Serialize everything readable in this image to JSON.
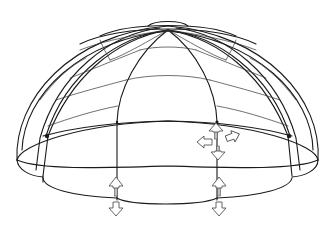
{
  "diagram": {
    "colors": {
      "line": "#1a1a1a",
      "arrow_outline": "#555555",
      "background": "#ffffff"
    },
    "dome": {
      "apex": [
        168,
        30
      ],
      "equator": {
        "cx": 168,
        "cy": 140,
        "rx": 151,
        "ry": 22
      },
      "rib_count": 12,
      "base_scallops": 5
    },
    "arrows": [
      {
        "id": "node-up",
        "x": 216,
        "y": 128,
        "direction": "up"
      },
      {
        "id": "node-left",
        "x": 206,
        "y": 142,
        "direction": "left"
      },
      {
        "id": "node-right",
        "x": 233,
        "y": 138,
        "direction": "right"
      },
      {
        "id": "node-down",
        "x": 218,
        "y": 153,
        "direction": "down"
      },
      {
        "id": "left-foot-up",
        "x": 116,
        "y": 181,
        "direction": "up"
      },
      {
        "id": "left-foot-down",
        "x": 116,
        "y": 210,
        "direction": "down"
      },
      {
        "id": "right-foot-up",
        "x": 219,
        "y": 181,
        "direction": "up"
      },
      {
        "id": "right-foot-down",
        "x": 219,
        "y": 210,
        "direction": "down"
      }
    ]
  }
}
